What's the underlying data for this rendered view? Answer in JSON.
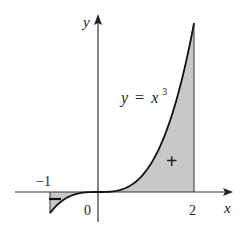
{
  "chart_data": {
    "type": "area",
    "title": "",
    "function": "y = x^3",
    "curve_label": {
      "lhs": "y",
      "eq": "=",
      "base": "x",
      "exp": "3"
    },
    "xlabel": "x",
    "ylabel": "y",
    "x_ticks": [
      {
        "value": -1,
        "label": "−1"
      },
      {
        "value": 0,
        "label": "0"
      },
      {
        "value": 2,
        "label": "2"
      }
    ],
    "xlim": [
      -1.7,
      2.8
    ],
    "ylim": [
      -1.4,
      8.4
    ],
    "shaded_interval": [
      -1,
      2
    ],
    "regions": [
      {
        "interval": [
          -1,
          0
        ],
        "sign": "−",
        "label": "negative area"
      },
      {
        "interval": [
          0,
          2
        ],
        "sign": "+",
        "label": "positive area"
      }
    ],
    "curve_points": {
      "x": [
        -1,
        -0.75,
        -0.5,
        -0.25,
        0,
        0.25,
        0.5,
        0.75,
        1,
        1.25,
        1.5,
        1.75,
        2
      ],
      "y": [
        -1,
        -0.422,
        -0.125,
        -0.016,
        0,
        0.016,
        0.125,
        0.422,
        1,
        1.953,
        3.375,
        5.359,
        8
      ]
    },
    "grid": false,
    "legend": "none",
    "colors": {
      "fill": "#c8c8c8",
      "curve": "#111111",
      "axis": "#333333"
    }
  }
}
